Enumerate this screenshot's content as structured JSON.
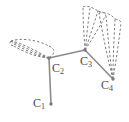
{
  "figure": {
    "kind": "molecular-orbital-diagram",
    "title": "",
    "width": 129,
    "height": 122,
    "background_color": "#ffffff",
    "bond_color": "#8c8c8c",
    "orbital_color": "#6e6e6e",
    "label_color": "#4a4a4a",
    "atoms": [
      {
        "id": "c1",
        "element": "C",
        "index": "1",
        "label": "C",
        "sub": "1",
        "x": 51,
        "y": 104
      },
      {
        "id": "c2",
        "element": "C",
        "index": "2",
        "label": "C",
        "sub": "2",
        "x": 49,
        "y": 58
      },
      {
        "id": "c3",
        "element": "C",
        "index": "3",
        "label": "C",
        "sub": "3",
        "x": 85,
        "y": 50
      },
      {
        "id": "c4",
        "element": "C",
        "index": "4",
        "label": "C",
        "sub": "4",
        "x": 113,
        "y": 79
      }
    ],
    "bonds": [
      {
        "from": "c1",
        "to": "c2",
        "style": "solid"
      },
      {
        "from": "c2",
        "to": "c3",
        "style": "solid"
      },
      {
        "from": "c3",
        "to": "c4",
        "style": "solid"
      }
    ],
    "orbitals": [
      {
        "name": "left-pi-lobe",
        "anchor_atom": "c2",
        "style": "dashed",
        "description": "dashed p-orbital lobe extending left from C2"
      },
      {
        "name": "upper-right-pi-lobe",
        "anchor_atom": "c3",
        "style": "dashed",
        "description": "dashed p-orbital lobe extending up-right from C3"
      },
      {
        "name": "lower-right-pi-lobe",
        "anchor_atom": "c4",
        "style": "dashed",
        "description": "dashed p-orbital lobe extending up from C4"
      }
    ]
  }
}
